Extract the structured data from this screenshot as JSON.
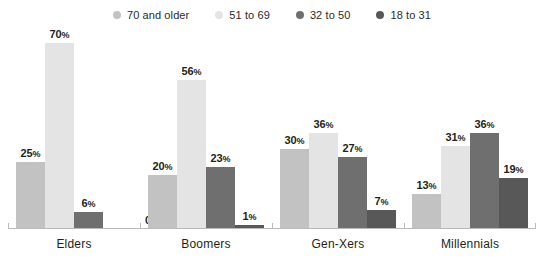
{
  "chart_data": {
    "type": "bar",
    "title": "",
    "subtitle": "",
    "xlabel": "",
    "ylabel": "",
    "ylim": [
      0,
      75
    ],
    "grid": false,
    "legend_position": "top-center",
    "value_suffix": "%",
    "categories": [
      "Elders",
      "Boomers",
      "Gen-Xers",
      "Millennials"
    ],
    "series": [
      {
        "name": "70 and older",
        "color": "#c2c2c2",
        "values": [
          25,
          20,
          30,
          13
        ]
      },
      {
        "name": "51 to 69",
        "color": "#e4e4e4",
        "values": [
          70,
          56,
          36,
          31
        ]
      },
      {
        "name": "32 to 50",
        "color": "#6f6f6f",
        "values": [
          6,
          23,
          27,
          36
        ]
      },
      {
        "name": "18 to 31",
        "color": "#585858",
        "values": [
          0,
          1,
          7,
          19
        ]
      }
    ],
    "data_labels": [
      [
        "25%",
        "70%",
        "6%",
        "0%"
      ],
      [
        "20%",
        "56%",
        "23%",
        "1%"
      ],
      [
        "30%",
        "36%",
        "27%",
        "7%"
      ],
      [
        "13%",
        "31%",
        "36%",
        "19%"
      ]
    ]
  },
  "legend": {
    "items": [
      {
        "label": "70 and older",
        "color": "#c2c2c2"
      },
      {
        "label": "51 to 69",
        "color": "#e4e4e4"
      },
      {
        "label": "32 to 50",
        "color": "#6f6f6f"
      },
      {
        "label": "18 to 31",
        "color": "#585858"
      }
    ]
  },
  "axis": {
    "baseline_color": "#b9b9b9",
    "labels": [
      "Elders",
      "Boomers",
      "Gen-Xers",
      "Millennials"
    ]
  }
}
